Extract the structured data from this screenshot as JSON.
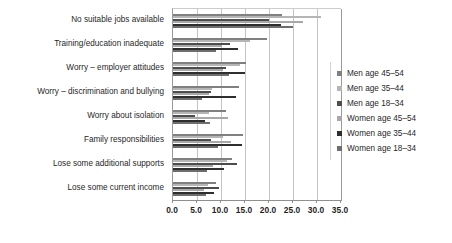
{
  "chart_data": {
    "type": "bar",
    "orientation": "horizontal",
    "title": "",
    "xlabel": "",
    "ylabel": "",
    "xlim": [
      0.0,
      35.0
    ],
    "xticks": [
      "0.0",
      "5.0",
      "10.0",
      "15.0",
      "20.0",
      "25.0",
      "30.0",
      "35.0"
    ],
    "xtick_step": 5.0,
    "grid": true,
    "legend_position": "right",
    "categories": [
      "No suitable jobs available",
      "Training/education inadequate",
      "Worry – employer attitudes",
      "Worry – discrimination and bullying",
      "Worry about isolation",
      "Family responsibilities",
      "Lose some additional supports",
      "Lose some current income"
    ],
    "series": [
      {
        "name": "Men age 45–54",
        "color": "#808080",
        "values": [
          22.8,
          19.5,
          15.2,
          13.8,
          11.0,
          14.6,
          12.2,
          9.0
        ]
      },
      {
        "name": "Men age 35–44",
        "color": "#b5b5b5",
        "values": [
          30.8,
          16.0,
          14.0,
          8.2,
          7.4,
          10.4,
          11.2,
          7.2
        ]
      },
      {
        "name": "Men age 18–34",
        "color": "#4d4d4d",
        "values": [
          20.0,
          11.8,
          11.0,
          8.0,
          4.6,
          8.0,
          13.4,
          9.6
        ]
      },
      {
        "name": "Women age 45–54",
        "color": "#a8a8a8",
        "values": [
          27.0,
          10.2,
          10.4,
          7.6,
          11.4,
          12.0,
          8.4,
          6.4
        ]
      },
      {
        "name": "Women age 35–44",
        "color": "#2e2e2e",
        "values": [
          22.6,
          13.6,
          15.0,
          13.2,
          6.6,
          14.4,
          10.6,
          8.6
        ]
      },
      {
        "name": "Women age 18–34",
        "color": "#6e6e6e",
        "values": [
          25.0,
          9.0,
          11.6,
          6.0,
          7.8,
          9.4,
          7.0,
          6.8
        ]
      }
    ]
  }
}
